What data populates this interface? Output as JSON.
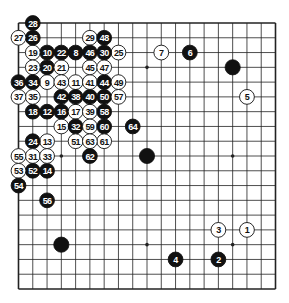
{
  "diagram": {
    "type": "go-board-game-record",
    "board_size": 19,
    "colors": {
      "black": "#111111",
      "white": "#ffffff",
      "line": "#222222",
      "background": "#ffffff"
    },
    "star_points": [
      [
        4,
        4
      ],
      [
        10,
        4
      ],
      [
        16,
        4
      ],
      [
        4,
        10
      ],
      [
        10,
        10
      ],
      [
        16,
        10
      ],
      [
        4,
        16
      ],
      [
        10,
        16
      ],
      [
        16,
        16
      ]
    ],
    "unnumbered_stones": [
      {
        "color": "black",
        "col": 16,
        "row": 4
      },
      {
        "color": "black",
        "col": 10,
        "row": 10
      },
      {
        "color": "black",
        "col": 4,
        "row": 16
      }
    ],
    "moves": [
      {
        "n": "1",
        "color": "white",
        "col": 17,
        "row": 15
      },
      {
        "n": "2",
        "color": "black",
        "col": 15,
        "row": 17
      },
      {
        "n": "3",
        "color": "white",
        "col": 15,
        "row": 15
      },
      {
        "n": "4",
        "color": "black",
        "col": 12,
        "row": 17
      },
      {
        "n": "5",
        "color": "white",
        "col": 17,
        "row": 6
      },
      {
        "n": "6",
        "color": "black",
        "col": 13,
        "row": 3
      },
      {
        "n": "7",
        "color": "white",
        "col": 11,
        "row": 3
      },
      {
        "n": "8",
        "color": "black",
        "col": 5,
        "row": 3
      },
      {
        "n": "9",
        "color": "white",
        "col": 3,
        "row": 5
      },
      {
        "n": "10",
        "color": "black",
        "col": 3,
        "row": 3
      },
      {
        "n": "11",
        "color": "white",
        "col": 5,
        "row": 5
      },
      {
        "n": "12",
        "color": "black",
        "col": 3,
        "row": 7
      },
      {
        "n": "13",
        "color": "white",
        "col": 3,
        "row": 9
      },
      {
        "n": "14",
        "color": "black",
        "col": 3,
        "row": 11
      },
      {
        "n": "15",
        "color": "white",
        "col": 4,
        "row": 8
      },
      {
        "n": "16",
        "color": "black",
        "col": 4,
        "row": 7
      },
      {
        "n": "17",
        "color": "white",
        "col": 5,
        "row": 7
      },
      {
        "n": "18",
        "color": "black",
        "col": 2,
        "row": 7
      },
      {
        "n": "19",
        "color": "white",
        "col": 2,
        "row": 3
      },
      {
        "n": "20",
        "color": "black",
        "col": 3,
        "row": 4
      },
      {
        "n": "21",
        "color": "white",
        "col": 4,
        "row": 4
      },
      {
        "n": "22",
        "color": "black",
        "col": 4,
        "row": 3
      },
      {
        "n": "23",
        "color": "white",
        "col": 2,
        "row": 4
      },
      {
        "n": "24",
        "color": "black",
        "col": 2,
        "row": 9
      },
      {
        "n": "25",
        "color": "white",
        "col": 8,
        "row": 3
      },
      {
        "n": "26",
        "color": "black",
        "col": 2,
        "row": 2
      },
      {
        "n": "27",
        "color": "white",
        "col": 1,
        "row": 2
      },
      {
        "n": "28",
        "color": "black",
        "col": 2,
        "row": 1
      },
      {
        "n": "29",
        "color": "white",
        "col": 6,
        "row": 2
      },
      {
        "n": "30",
        "color": "black",
        "col": 7,
        "row": 3
      },
      {
        "n": "31",
        "color": "white",
        "col": 2,
        "row": 10
      },
      {
        "n": "32",
        "color": "black",
        "col": 5,
        "row": 8
      },
      {
        "n": "33",
        "color": "white",
        "col": 3,
        "row": 10
      },
      {
        "n": "34",
        "color": "black",
        "col": 2,
        "row": 5
      },
      {
        "n": "35",
        "color": "white",
        "col": 2,
        "row": 6
      },
      {
        "n": "36",
        "color": "black",
        "col": 1,
        "row": 5
      },
      {
        "n": "37",
        "color": "white",
        "col": 1,
        "row": 6
      },
      {
        "n": "38",
        "color": "black",
        "col": 5,
        "row": 6
      },
      {
        "n": "39",
        "color": "white",
        "col": 6,
        "row": 7
      },
      {
        "n": "40",
        "color": "black",
        "col": 6,
        "row": 6
      },
      {
        "n": "41",
        "color": "white",
        "col": 6,
        "row": 5
      },
      {
        "n": "42",
        "color": "black",
        "col": 4,
        "row": 6
      },
      {
        "n": "43",
        "color": "white",
        "col": 4,
        "row": 5
      },
      {
        "n": "44",
        "color": "black",
        "col": 7,
        "row": 5
      },
      {
        "n": "45",
        "color": "white",
        "col": 6,
        "row": 4
      },
      {
        "n": "46",
        "color": "black",
        "col": 6,
        "row": 3
      },
      {
        "n": "47",
        "color": "white",
        "col": 7,
        "row": 4
      },
      {
        "n": "48",
        "color": "black",
        "col": 7,
        "row": 2
      },
      {
        "n": "49",
        "color": "white",
        "col": 8,
        "row": 5
      },
      {
        "n": "50",
        "color": "black",
        "col": 7,
        "row": 6
      },
      {
        "n": "51",
        "color": "white",
        "col": 5,
        "row": 9
      },
      {
        "n": "52",
        "color": "black",
        "col": 2,
        "row": 11
      },
      {
        "n": "53",
        "color": "white",
        "col": 1,
        "row": 11
      },
      {
        "n": "54",
        "color": "black",
        "col": 1,
        "row": 12
      },
      {
        "n": "55",
        "color": "white",
        "col": 1,
        "row": 10
      },
      {
        "n": "56",
        "color": "black",
        "col": 3,
        "row": 13
      },
      {
        "n": "57",
        "color": "white",
        "col": 8,
        "row": 6
      },
      {
        "n": "58",
        "color": "black",
        "col": 7,
        "row": 7
      },
      {
        "n": "59",
        "color": "white",
        "col": 6,
        "row": 8
      },
      {
        "n": "60",
        "color": "black",
        "col": 7,
        "row": 8
      },
      {
        "n": "61",
        "color": "white",
        "col": 7,
        "row": 9
      },
      {
        "n": "62",
        "color": "black",
        "col": 6,
        "row": 10
      },
      {
        "n": "63",
        "color": "white",
        "col": 6,
        "row": 9
      },
      {
        "n": "64",
        "color": "black",
        "col": 9,
        "row": 8
      }
    ]
  }
}
